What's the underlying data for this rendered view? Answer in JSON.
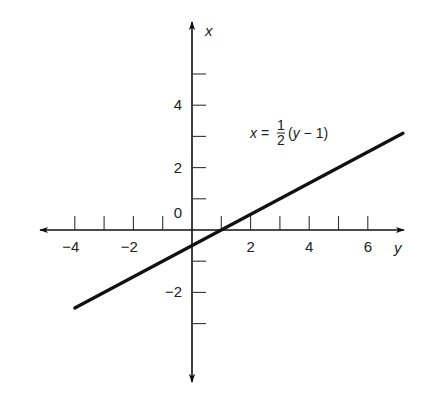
{
  "chart_data": {
    "type": "line",
    "title": "",
    "xlabel": "y",
    "ylabel": "x",
    "horizontal_axis": {
      "variable": "y",
      "range": [
        -5,
        7
      ],
      "ticks": [
        -4,
        -3,
        -2,
        -1,
        1,
        2,
        3,
        4,
        5,
        6
      ],
      "tick_labels": [
        {
          "value": -4,
          "text": "−4"
        },
        {
          "value": -2,
          "text": "−2"
        },
        {
          "value": 2,
          "text": "2"
        },
        {
          "value": 4,
          "text": "4"
        },
        {
          "value": 6,
          "text": "6"
        }
      ]
    },
    "vertical_axis": {
      "variable": "x",
      "range": [
        -5,
        6.5
      ],
      "ticks": [
        -3,
        -2,
        -1,
        1,
        2,
        3,
        4,
        5
      ],
      "tick_labels": [
        {
          "value": 4,
          "text": "4"
        },
        {
          "value": 2,
          "text": "2"
        },
        {
          "value": 0,
          "text": "0"
        },
        {
          "value": -2,
          "text": "−2"
        }
      ]
    },
    "grid": false,
    "series": [
      {
        "name": "x = 1/2 (y - 1)",
        "equation": "x = (y - 1) / 2",
        "points": [
          {
            "y": -4,
            "x": -2.5
          },
          {
            "y": 7.2,
            "x": 3.1
          }
        ]
      }
    ],
    "annotations": [
      {
        "text_prefix": "x = ",
        "fraction_numerator": "1",
        "fraction_denominator": "2",
        "text_suffix": "(y − 1)",
        "anchor_data": {
          "y": 2,
          "x": 3
        }
      }
    ]
  }
}
